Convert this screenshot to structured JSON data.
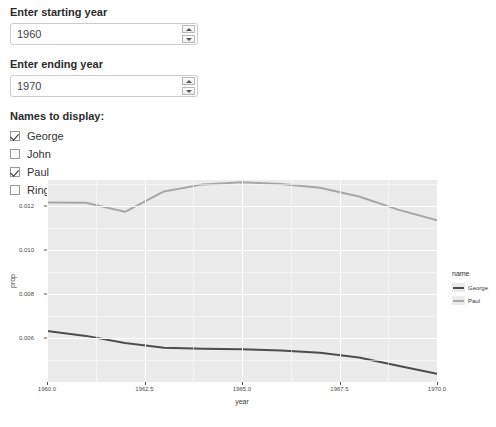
{
  "form": {
    "start_year": {
      "label": "Enter starting year",
      "value": "1960"
    },
    "end_year": {
      "label": "Enter ending year",
      "value": "1970"
    },
    "names_title": "Names to display:",
    "checkboxes": [
      {
        "label": "George",
        "checked": true
      },
      {
        "label": "John",
        "checked": false
      },
      {
        "label": "Paul",
        "checked": true
      },
      {
        "label": "Ringo",
        "checked": false
      }
    ]
  },
  "chart_data": {
    "type": "line",
    "title": "",
    "xlabel": "year",
    "ylabel": "prop",
    "xlim": [
      1960,
      1970
    ],
    "ylim": [
      0.004,
      0.0132
    ],
    "xticks": [
      "1960.0",
      "1962.5",
      "1965.0",
      "1967.5",
      "1970.0"
    ],
    "xtick_values": [
      1960,
      1962.5,
      1965,
      1967.5,
      1970
    ],
    "yticks": [
      "0.012",
      "0.010",
      "0.008",
      "0.006"
    ],
    "ytick_values": [
      0.012,
      0.01,
      0.008,
      0.006
    ],
    "grid": true,
    "legend_title": "name",
    "legend_position": "right",
    "x": [
      1960,
      1961,
      1962,
      1963,
      1964,
      1965,
      1966,
      1967,
      1968,
      1969,
      1970
    ],
    "series": [
      {
        "name": "George",
        "color": "#4d4d4d",
        "values": [
          0.00632,
          0.0061,
          0.00578,
          0.00556,
          0.00552,
          0.00549,
          0.00543,
          0.00533,
          0.00512,
          0.00474,
          0.00437
        ]
      },
      {
        "name": "Paul",
        "color": "#a7a7a7",
        "values": [
          0.01218,
          0.01216,
          0.01175,
          0.01268,
          0.013,
          0.0131,
          0.01302,
          0.01285,
          0.01245,
          0.01185,
          0.01137
        ]
      }
    ]
  }
}
